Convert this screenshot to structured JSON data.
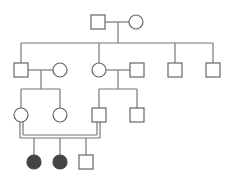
{
  "diagram": {
    "type": "pedigree",
    "colors": {
      "line": "#777777",
      "symbol_outline": "#666666",
      "affected_fill": "#444444",
      "background": "#ffffff"
    },
    "legend": {
      "square": "male",
      "circle": "female",
      "filled": "affected",
      "double_line": "consanguineous mating"
    },
    "generations": [
      {
        "label": "I",
        "individuals": [
          {
            "id": "I-1",
            "sex": "male",
            "affected": false
          },
          {
            "id": "I-2",
            "sex": "female",
            "affected": false
          }
        ]
      },
      {
        "label": "II",
        "individuals": [
          {
            "id": "II-1",
            "sex": "male",
            "affected": false
          },
          {
            "id": "II-1-spouse",
            "sex": "female",
            "affected": false
          },
          {
            "id": "II-2",
            "sex": "female",
            "affected": false
          },
          {
            "id": "II-2-spouse",
            "sex": "male",
            "affected": false
          },
          {
            "id": "II-3",
            "sex": "male",
            "affected": false
          },
          {
            "id": "II-4",
            "sex": "male",
            "affected": false
          }
        ]
      },
      {
        "label": "III",
        "individuals": [
          {
            "id": "III-1",
            "sex": "female",
            "affected": false
          },
          {
            "id": "III-2",
            "sex": "female",
            "affected": false
          },
          {
            "id": "III-3",
            "sex": "male",
            "affected": false
          },
          {
            "id": "III-4",
            "sex": "male",
            "affected": false
          }
        ]
      },
      {
        "label": "IV",
        "individuals": [
          {
            "id": "IV-1",
            "sex": "female",
            "affected": true
          },
          {
            "id": "IV-2",
            "sex": "female",
            "affected": true
          },
          {
            "id": "IV-3",
            "sex": "male",
            "affected": false
          }
        ]
      }
    ],
    "matings": [
      {
        "partners": [
          "I-1",
          "I-2"
        ],
        "consanguineous": false
      },
      {
        "partners": [
          "II-1",
          "II-1-spouse"
        ],
        "consanguineous": false
      },
      {
        "partners": [
          "II-2",
          "II-2-spouse"
        ],
        "consanguineous": false
      },
      {
        "partners": [
          "III-1",
          "III-3"
        ],
        "consanguineous": true
      }
    ]
  }
}
